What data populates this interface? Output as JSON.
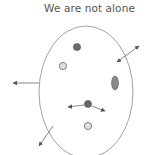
{
  "title": "We are not alone",
  "colors": {
    "outline": "#8a8a8a",
    "dark_dot": "#6a6a6a",
    "light_dot": "#d8d8d8",
    "arrow": "#555555"
  },
  "cell": {
    "shape": "ellipse",
    "cx": 86,
    "cy": 92,
    "rx": 47,
    "ry": 66
  },
  "particles": [
    {
      "type": "dark",
      "cx": 77,
      "cy": 47
    },
    {
      "type": "light",
      "cx": 63,
      "cy": 66
    },
    {
      "type": "oval",
      "cx": 115,
      "cy": 83
    },
    {
      "type": "dark",
      "cx": 88,
      "cy": 104
    },
    {
      "type": "light",
      "cx": 88,
      "cy": 126
    }
  ]
}
